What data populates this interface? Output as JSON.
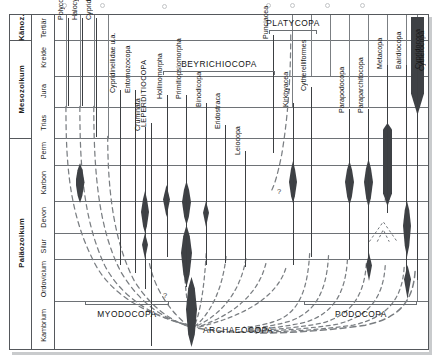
{
  "figure": {
    "kind": "stratigraphic-range-chart",
    "language": "de",
    "title": ""
  },
  "time_axis": {
    "eras": [
      {
        "label": "Känoz.",
        "top_pct": 0.0,
        "height_pct": 7.5
      },
      {
        "label": "Mesozoikum",
        "top_pct": 7.5,
        "height_pct": 29.0
      },
      {
        "label": "Paläozoikum",
        "top_pct": 36.5,
        "height_pct": 63.5
      }
    ],
    "periods": [
      {
        "label": "Tertiär",
        "top_pct": 0.0,
        "height_pct": 7.5
      },
      {
        "label": "Kreide",
        "top_pct": 7.5,
        "height_pct": 10.5
      },
      {
        "label": "Jura",
        "top_pct": 18.0,
        "height_pct": 9.5
      },
      {
        "label": "Trias",
        "top_pct": 27.5,
        "height_pct": 9.0
      },
      {
        "label": "Perm",
        "top_pct": 36.5,
        "height_pct": 8.0
      },
      {
        "label": "Karbon",
        "top_pct": 44.5,
        "height_pct": 11.0
      },
      {
        "label": "Devon",
        "top_pct": 55.5,
        "height_pct": 9.5
      },
      {
        "label": "Silur",
        "top_pct": 65.0,
        "height_pct": 7.5
      },
      {
        "label": "Ordovicium",
        "top_pct": 72.5,
        "height_pct": 12.5
      },
      {
        "label": "Kambrium",
        "top_pct": 85.0,
        "height_pct": 15.0
      }
    ]
  },
  "taxa": [
    {
      "name": "Polycopiformes",
      "x_pct": 3.5,
      "top_pct": 1.0,
      "bottom_pct": 33.0,
      "label_top_pct": 2.0
    },
    {
      "name": "Halocypriformes",
      "x_pct": 9.5,
      "top_pct": 1.0,
      "bottom_pct": 30.0,
      "label_top_pct": 2.0
    },
    {
      "name": "Cypridiniformes",
      "x_pct": 15.8,
      "top_pct": 1.0,
      "bottom_pct": 40.0,
      "label_top_pct": 2.0
    },
    {
      "name": "Cypridinellidae u.a.",
      "x_pct": 24.0,
      "top_pct": 22.5,
      "bottom_pct": 72.0,
      "label_top_pct": 23.5
    },
    {
      "name": "Entomozocopa",
      "x_pct": 29.5,
      "top_pct": 22.5,
      "bottom_pct": 76.0,
      "label_top_pct": 23.5
    },
    {
      "name": "LEPERDITIOCOPA",
      "x_pct": 35.5,
      "top_pct": 32.0,
      "bottom_pct": 99.0,
      "label_top_pct": 33.0,
      "emphasis": true
    },
    {
      "name": "Cruminata",
      "x_pct": 46.0,
      "top_pct": 33.0,
      "bottom_pct": 83.0,
      "label_top_pct": 34.0
    },
    {
      "name": "Hollinomorpha",
      "x_pct": 52.0,
      "top_pct": 23.5,
      "bottom_pct": 85.0,
      "label_top_pct": 24.5
    },
    {
      "name": "Primitiopsiomorpha",
      "x_pct": 57.5,
      "top_pct": 23.5,
      "bottom_pct": 87.0,
      "label_top_pct": 24.5
    },
    {
      "name": "Binodicopa",
      "x_pct": 63.0,
      "top_pct": 26.0,
      "bottom_pct": 88.0,
      "label_top_pct": 27.0
    },
    {
      "name": "Eridostraca",
      "x_pct": 68.5,
      "top_pct": 32.5,
      "bottom_pct": 89.0,
      "label_top_pct": 33.5
    },
    {
      "name": "Leiocopa",
      "x_pct": 74.0,
      "top_pct": 40.0,
      "bottom_pct": 90.0,
      "label_top_pct": 41.0
    },
    {
      "name": "Punciacea",
      "x_pct": 87.0,
      "top_pct": 6.0,
      "bottom_pct": 44.5,
      "label_top_pct": 7.5
    },
    {
      "name": "Kirkbyacea",
      "x_pct": 92.5,
      "top_pct": 26.0,
      "bottom_pct": 90.5,
      "label_top_pct": 27.5
    },
    {
      "name": "Cytherelliformes",
      "x_pct": 98.5,
      "top_pct": 21.0,
      "bottom_pct": 91.5,
      "label_top_pct": 22.5
    },
    {
      "name": "Parapodocopa",
      "x_pct": 105.5,
      "top_pct": 27.5,
      "bottom_pct": 92.0,
      "label_top_pct": 29.0
    },
    {
      "name": "Paraparchitocopa",
      "x_pct": 111.0,
      "top_pct": 27.5,
      "bottom_pct": 93.0,
      "label_top_pct": 29.0
    },
    {
      "name": "Metacopa",
      "x_pct": 117.5,
      "top_pct": 14.5,
      "bottom_pct": 94.0,
      "label_top_pct": 16.0
    },
    {
      "name": "Bairdiocopa",
      "x_pct": 123.5,
      "top_pct": 14.5,
      "bottom_pct": 95.0,
      "label_top_pct": 16.0
    },
    {
      "name": "Cypridocopa",
      "x_pct": 129.5,
      "top_pct": 14.5,
      "bottom_pct": 96.0,
      "label_top_pct": 16.0
    },
    {
      "name": "Cytherocopa",
      "x_pct": 136.0,
      "top_pct": 1.0,
      "bottom_pct": 96.5,
      "label_top_pct": 16.0
    }
  ],
  "groups": [
    {
      "label": "BEYRICHIOCOPA",
      "left_pct": 43.0,
      "right_pct": 77.0,
      "y_pct": 14.0
    },
    {
      "label": "PLATYCOPA",
      "left_pct": 84.0,
      "right_pct": 101.0,
      "y_pct": 3.5
    },
    {
      "label": "MYODOCOPA",
      "left_pct": 11.0,
      "right_pct": 35.0,
      "y_pct": 86.0
    },
    {
      "label": "PODOCOPA",
      "left_pct": 91.0,
      "right_pct": 139.0,
      "y_pct": 86.0
    },
    {
      "label": "ARCHAEOCOPA",
      "left_pct": 42.0,
      "right_pct": 42.0,
      "y_pct": 93.5
    }
  ],
  "annotations": {
    "question_marks": [
      "?",
      "?"
    ]
  },
  "colors": {
    "spindle": "#3e4145",
    "grid": "#6e7276",
    "frame": "#55585c",
    "lineage": "#6d7175",
    "text": "#141414"
  }
}
